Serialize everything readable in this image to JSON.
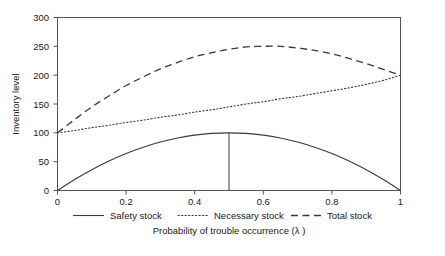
{
  "chart_data": {
    "type": "line",
    "title": "",
    "xlabel": "Probability of trouble occurrence (λ )",
    "ylabel": "Inventory level",
    "xlim": [
      0,
      1
    ],
    "ylim": [
      0,
      300
    ],
    "grid": false,
    "legend_position": "bottom",
    "xticks": [
      0,
      0.2,
      0.4,
      0.6,
      0.8,
      1
    ],
    "xtick_labels": [
      "0",
      "0.2",
      "0.4",
      "0.6",
      "0.8",
      "1"
    ],
    "yticks": [
      0,
      50,
      100,
      150,
      200,
      250,
      300
    ],
    "ytick_labels": [
      "0",
      "50",
      "100",
      "150",
      "200",
      "250",
      "300"
    ],
    "x": [
      0,
      0.05,
      0.1,
      0.15,
      0.2,
      0.25,
      0.3,
      0.35,
      0.4,
      0.45,
      0.5,
      0.55,
      0.6,
      0.65,
      0.7,
      0.75,
      0.8,
      0.85,
      0.9,
      0.95,
      1
    ],
    "series": [
      {
        "name": "Safety stock",
        "style": "solid",
        "values": [
          0,
          19,
          36,
          51,
          64,
          75,
          84,
          91,
          96,
          99,
          100,
          99,
          96,
          91,
          84,
          75,
          64,
          51,
          36,
          19,
          0
        ]
      },
      {
        "name": "Necessary stock",
        "style": "dotted",
        "values": [
          100,
          104,
          109,
          113,
          118,
          122,
          127,
          131,
          136,
          140,
          145,
          150,
          154,
          159,
          163,
          168,
          173,
          178,
          184,
          191,
          200
        ]
      },
      {
        "name": "Total stock",
        "style": "dashed",
        "values": [
          100,
          123,
          145,
          164,
          182,
          197,
          211,
          222,
          232,
          239,
          245,
          249,
          250,
          250,
          247,
          243,
          237,
          229,
          220,
          210,
          200
        ]
      }
    ],
    "annotations": [
      {
        "name": "optimum-marker",
        "type": "vertical-line",
        "x": 0.5,
        "y_from": 0,
        "y_to": 100
      }
    ]
  },
  "legend": {
    "items": [
      {
        "label": "Safety stock",
        "style": "solid"
      },
      {
        "label": "Necessary stock",
        "style": "dotted"
      },
      {
        "label": "Total stock",
        "style": "dashed"
      }
    ]
  },
  "caption": {
    "text": ""
  }
}
